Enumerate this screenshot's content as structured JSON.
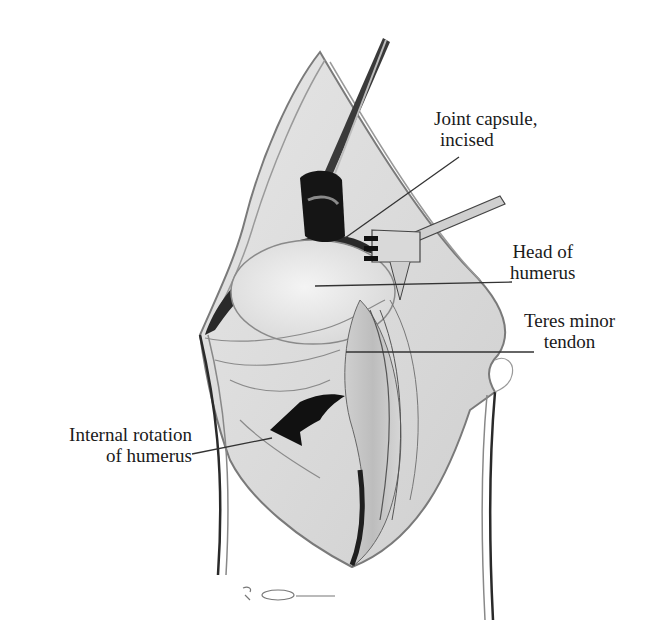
{
  "figure": {
    "background_color": "#ffffff",
    "ink_color": "#1a1a1a",
    "tissue_color": "#d9d9d9",
    "shadow_color": "#2a2a2a"
  },
  "labels": {
    "joint_capsule": {
      "line1": "Joint capsule,",
      "line2": "incised"
    },
    "head_of_humerus": {
      "line1": "Head of",
      "line2": "humerus"
    },
    "teres_minor": {
      "line1": "Teres minor",
      "line2": "tendon"
    },
    "internal_rotation": {
      "line1": "Internal rotation",
      "line2": "of humerus"
    }
  },
  "signature": {
    "text": "signature",
    "icon": "artist-signature-icon"
  }
}
